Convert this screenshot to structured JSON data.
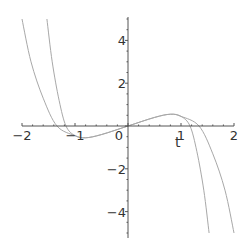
{
  "chart_data": {
    "type": "line",
    "title": "",
    "xlabel": "t",
    "ylabel": "",
    "xlim": [
      -2,
      2
    ],
    "ylim": [
      -5,
      5
    ],
    "grid": false,
    "legend": null,
    "x_ticks": [
      -2,
      -1,
      0,
      1,
      2
    ],
    "x_tick_labels": [
      "-2",
      "-1",
      "0",
      "1",
      "2"
    ],
    "y_ticks": [
      -4,
      -2,
      2,
      4
    ],
    "y_tick_labels": [
      "-4",
      "-2",
      "2",
      "4"
    ],
    "series": [
      {
        "name": "curve-a",
        "color": "#a8a8a8",
        "points": [
          [
            -2.0,
            5.0
          ],
          [
            -1.83,
            3.0
          ],
          [
            -1.6,
            1.3
          ],
          [
            -1.34,
            0.0
          ],
          [
            -1.0,
            -0.45
          ],
          [
            -0.8,
            -0.55
          ],
          [
            -0.5,
            -0.4
          ],
          [
            0.0,
            0.0
          ],
          [
            0.5,
            0.4
          ],
          [
            0.8,
            0.55
          ],
          [
            1.0,
            0.45
          ],
          [
            1.34,
            0.0
          ],
          [
            1.6,
            -1.3
          ],
          [
            1.83,
            -3.0
          ],
          [
            2.0,
            -5.0
          ]
        ]
      },
      {
        "name": "curve-b",
        "color": "#a8a8a8",
        "points": [
          [
            -1.53,
            5.0
          ],
          [
            -1.43,
            3.0
          ],
          [
            -1.3,
            1.2
          ],
          [
            -1.17,
            0.0
          ],
          [
            -1.0,
            -0.45
          ],
          [
            -0.8,
            -0.55
          ],
          [
            -0.5,
            -0.4
          ],
          [
            0.0,
            0.0
          ],
          [
            0.5,
            0.4
          ],
          [
            0.8,
            0.55
          ],
          [
            1.0,
            0.45
          ],
          [
            1.17,
            0.0
          ],
          [
            1.3,
            -1.2
          ],
          [
            1.43,
            -3.0
          ],
          [
            1.53,
            -5.0
          ]
        ]
      }
    ]
  },
  "colors": {
    "axis": "#555555",
    "curve": "#a8a8a8"
  }
}
